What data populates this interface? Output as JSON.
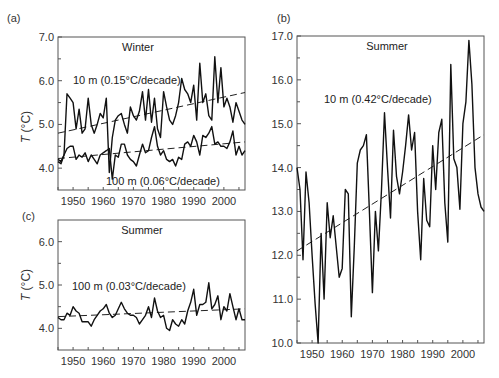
{
  "chart_data": [
    {
      "panel": "(a)",
      "type": "line",
      "title": "Winter",
      "xlabel": "",
      "ylabel": "T (°C)",
      "xlim": [
        1945,
        2007
      ],
      "ylim": [
        3.5,
        7.0
      ],
      "xticks": [
        1950,
        1960,
        1970,
        1980,
        1990,
        2000
      ],
      "yticks": [
        "4.0",
        "5.0",
        "6.0",
        "7.0"
      ],
      "grid": false,
      "series": [
        {
          "name": "10 m (0.15°C/decade)",
          "x": [
            1945,
            1946,
            1947,
            1948,
            1949,
            1950,
            1951,
            1952,
            1953,
            1954,
            1955,
            1956,
            1957,
            1958,
            1959,
            1960,
            1961,
            1962,
            1963,
            1964,
            1965,
            1966,
            1967,
            1968,
            1969,
            1970,
            1971,
            1972,
            1973,
            1974,
            1975,
            1976,
            1977,
            1978,
            1979,
            1980,
            1981,
            1982,
            1983,
            1984,
            1985,
            1986,
            1987,
            1988,
            1989,
            1990,
            1991,
            1992,
            1993,
            1994,
            1995,
            1996,
            1997,
            1998,
            1999,
            2000,
            2001,
            2002,
            2003,
            2004,
            2005,
            2006,
            2007
          ],
          "values": [
            4.2,
            4.15,
            4.3,
            5.7,
            5.6,
            5.5,
            4.9,
            5.35,
            4.8,
            4.9,
            5.6,
            5.0,
            4.8,
            5.0,
            5.25,
            5.15,
            5.6,
            3.9,
            4.7,
            5.1,
            5.2,
            5.25,
            5.0,
            4.8,
            5.4,
            5.2,
            5.1,
            5.3,
            5.75,
            5.1,
            5.8,
            5.05,
            5.6,
            4.9,
            4.7,
            5.75,
            5.4,
            5.1,
            5.0,
            5.2,
            5.5,
            6.05,
            5.8,
            5.7,
            5.5,
            5.9,
            5.1,
            6.4,
            5.5,
            5.7,
            5.2,
            5.1,
            6.55,
            5.5,
            6.3,
            5.4,
            5.6,
            5.4,
            5.05,
            5.5,
            5.3,
            5.1,
            5.0
          ]
        },
        {
          "name": "100 m (0.06°C/decade)",
          "x": [
            1945,
            1946,
            1947,
            1948,
            1949,
            1950,
            1951,
            1952,
            1953,
            1954,
            1955,
            1956,
            1957,
            1958,
            1959,
            1960,
            1961,
            1962,
            1963,
            1964,
            1965,
            1966,
            1967,
            1968,
            1969,
            1970,
            1971,
            1972,
            1973,
            1974,
            1975,
            1976,
            1977,
            1978,
            1979,
            1980,
            1981,
            1982,
            1983,
            1984,
            1985,
            1986,
            1987,
            1988,
            1989,
            1990,
            1991,
            1992,
            1993,
            1994,
            1995,
            1996,
            1997,
            1998,
            1999,
            2000,
            2001,
            2002,
            2003,
            2004,
            2005,
            2006,
            2007
          ],
          "values": [
            4.15,
            4.1,
            4.3,
            4.45,
            4.5,
            4.5,
            4.2,
            4.3,
            4.25,
            4.35,
            4.15,
            4.3,
            4.2,
            4.1,
            4.3,
            4.35,
            4.4,
            4.45,
            3.75,
            4.3,
            4.25,
            4.55,
            4.55,
            4.3,
            4.2,
            4.15,
            4.05,
            4.3,
            4.55,
            4.35,
            4.4,
            4.7,
            4.95,
            4.5,
            4.3,
            4.4,
            4.2,
            4.15,
            4.2,
            4.05,
            4.25,
            4.2,
            4.55,
            4.6,
            4.5,
            4.75,
            4.6,
            4.3,
            4.75,
            4.7,
            4.8,
            4.95,
            4.55,
            4.6,
            4.5,
            4.5,
            4.45,
            4.6,
            4.85,
            4.3,
            4.5,
            4.3,
            4.4
          ]
        }
      ],
      "trend_lines": [
        {
          "name": "10 m trend",
          "x": [
            1945,
            2007
          ],
          "y": [
            4.8,
            5.73
          ]
        },
        {
          "name": "100 m trend",
          "x": [
            1945,
            2007
          ],
          "y": [
            4.22,
            4.6
          ]
        }
      ],
      "annotations": [
        "Winter",
        "10 m (0.15°C/decade)",
        "100 m (0.06°C/decade)"
      ]
    },
    {
      "panel": "(b)",
      "type": "line",
      "title": "Summer",
      "xlabel": "",
      "ylabel": "",
      "xlim": [
        1945,
        2007
      ],
      "ylim": [
        10.0,
        17.0
      ],
      "xticks": [
        1950,
        1960,
        1970,
        1980,
        1990,
        2000
      ],
      "yticks": [
        "10.0",
        "11.0",
        "12.0",
        "13.0",
        "14.0",
        "15.0",
        "16.0",
        "17.0"
      ],
      "grid": false,
      "series": [
        {
          "name": "10 m (0.42°C/decade)",
          "x": [
            1945,
            1946,
            1947,
            1948,
            1949,
            1950,
            1951,
            1952,
            1953,
            1954,
            1955,
            1956,
            1957,
            1958,
            1959,
            1960,
            1961,
            1962,
            1963,
            1964,
            1965,
            1966,
            1967,
            1968,
            1969,
            1970,
            1971,
            1972,
            1973,
            1974,
            1975,
            1976,
            1977,
            1978,
            1979,
            1980,
            1981,
            1982,
            1983,
            1984,
            1985,
            1986,
            1987,
            1988,
            1989,
            1990,
            1991,
            1992,
            1993,
            1994,
            1995,
            1996,
            1997,
            1998,
            1999,
            2000,
            2001,
            2002,
            2003,
            2004,
            2005,
            2006,
            2007
          ],
          "values": [
            14.0,
            13.5,
            11.9,
            13.9,
            13.2,
            12.0,
            10.9,
            10.0,
            12.5,
            11.0,
            13.2,
            12.4,
            12.9,
            12.2,
            11.5,
            11.7,
            13.5,
            13.4,
            10.6,
            12.2,
            14.1,
            14.4,
            14.5,
            14.75,
            13.0,
            11.15,
            13.0,
            12.1,
            13.5,
            15.25,
            14.0,
            12.85,
            14.85,
            13.8,
            13.4,
            13.9,
            14.5,
            15.2,
            14.4,
            14.8,
            13.0,
            11.9,
            13.75,
            12.8,
            12.65,
            14.5,
            13.5,
            14.8,
            15.1,
            13.2,
            12.3,
            16.35,
            14.2,
            14.0,
            13.05,
            15.0,
            15.5,
            16.9,
            15.9,
            14.0,
            13.4,
            13.1,
            13.0
          ]
        }
      ],
      "trend_lines": [
        {
          "name": "10 m trend",
          "x": [
            1945,
            2007
          ],
          "y": [
            12.1,
            14.75
          ]
        }
      ],
      "annotations": [
        "Summer",
        "10 m (0.42°C/decade)"
      ]
    },
    {
      "panel": "(c)",
      "type": "line",
      "title": "Summer",
      "xlabel": "",
      "ylabel": "T (°C)",
      "xlim": [
        1945,
        2007
      ],
      "ylim": [
        3.5,
        6.5
      ],
      "xticks": [
        1950,
        1960,
        1970,
        1980,
        1990,
        2000
      ],
      "yticks": [
        "4.0",
        "5.0",
        "6.0"
      ],
      "grid": false,
      "series": [
        {
          "name": "100 m (0.03°C/decade)",
          "x": [
            1945,
            1946,
            1947,
            1948,
            1949,
            1950,
            1951,
            1952,
            1953,
            1954,
            1955,
            1956,
            1957,
            1958,
            1959,
            1960,
            1961,
            1962,
            1963,
            1964,
            1965,
            1966,
            1967,
            1968,
            1969,
            1970,
            1971,
            1972,
            1973,
            1974,
            1975,
            1976,
            1977,
            1978,
            1979,
            1980,
            1981,
            1982,
            1983,
            1984,
            1985,
            1986,
            1987,
            1988,
            1989,
            1990,
            1991,
            1992,
            1993,
            1994,
            1995,
            1996,
            1997,
            1998,
            1999,
            2000,
            2001,
            2002,
            2003,
            2004,
            2005,
            2006,
            2007
          ],
          "values": [
            4.25,
            4.2,
            4.2,
            4.35,
            4.3,
            4.5,
            4.4,
            4.35,
            4.15,
            4.15,
            4.15,
            4.05,
            4.2,
            4.3,
            4.4,
            4.45,
            4.55,
            4.35,
            4.25,
            4.3,
            4.45,
            4.6,
            4.45,
            4.35,
            4.3,
            4.3,
            4.25,
            4.1,
            4.2,
            4.3,
            4.5,
            4.25,
            4.7,
            4.4,
            4.25,
            4.3,
            4.0,
            3.95,
            4.2,
            4.1,
            4.05,
            4.2,
            4.1,
            4.4,
            4.6,
            4.9,
            4.3,
            4.55,
            4.55,
            4.6,
            5.05,
            4.45,
            4.55,
            4.75,
            4.2,
            4.5,
            4.4,
            4.8,
            4.5,
            4.2,
            4.45,
            4.2,
            4.2
          ]
        }
      ],
      "trend_lines": [
        {
          "name": "100 m trend",
          "x": [
            1945,
            2007
          ],
          "y": [
            4.27,
            4.45
          ]
        }
      ],
      "annotations": [
        "Summer",
        "100 m (0.03°C/decade)"
      ]
    }
  ],
  "labels": {
    "a": {
      "panel": "(a)",
      "title": "Winter",
      "ylabel_T": "T",
      "ylabel_unit": " (°C)",
      "ann1": "10 m (0.15°C/decade)",
      "ann2": "100 m (0.06°C/decade)"
    },
    "b": {
      "panel": "(b)",
      "title": "Summer",
      "ann1": "10 m (0.42°C/decade)"
    },
    "c": {
      "panel": "(c)",
      "title": "Summer",
      "ylabel_T": "T",
      "ylabel_unit": " (°C)",
      "ann1": "100 m (0.03°C/decade)"
    }
  }
}
